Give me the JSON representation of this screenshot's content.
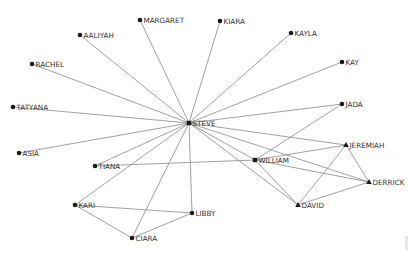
{
  "graph": {
    "type": "network",
    "colors": {
      "edge": "#8a8a8a",
      "node": "#1a1a1a",
      "label": "#333333",
      "background": "#ffffff"
    },
    "nodes": [
      {
        "id": "STEVE",
        "label": "STEVE",
        "x": 189,
        "y": 123,
        "shape": "square"
      },
      {
        "id": "MARGARET",
        "label": "MARGARET",
        "x": 140,
        "y": 20,
        "shape": "circle"
      },
      {
        "id": "KIARA",
        "label": "KIARA",
        "x": 220,
        "y": 21,
        "shape": "circle"
      },
      {
        "id": "KAYLA",
        "label": "KAYLA",
        "x": 291,
        "y": 33,
        "shape": "circle"
      },
      {
        "id": "KAY",
        "label": "KAY",
        "x": 342,
        "y": 62,
        "shape": "circle"
      },
      {
        "id": "JADA",
        "label": "JADA",
        "x": 342,
        "y": 104,
        "shape": "circle"
      },
      {
        "id": "AALIYAH",
        "label": "AALIYAH",
        "x": 80,
        "y": 35,
        "shape": "circle"
      },
      {
        "id": "RACHEL",
        "label": "RACHEL",
        "x": 32,
        "y": 64,
        "shape": "circle"
      },
      {
        "id": "TATYANA",
        "label": "TATYANA",
        "x": 13,
        "y": 107,
        "shape": "circle"
      },
      {
        "id": "ASIA",
        "label": "ASIA",
        "x": 19,
        "y": 153,
        "shape": "circle"
      },
      {
        "id": "TIANA",
        "label": "TIANA",
        "x": 95,
        "y": 166,
        "shape": "circle"
      },
      {
        "id": "KARI",
        "label": "KARI",
        "x": 75,
        "y": 205,
        "shape": "circle"
      },
      {
        "id": "CIARA",
        "label": "CIARA",
        "x": 132,
        "y": 238,
        "shape": "circle"
      },
      {
        "id": "LIBBY",
        "label": "LIBBY",
        "x": 192,
        "y": 213,
        "shape": "circle"
      },
      {
        "id": "WILLIAM",
        "label": "WILLIAM",
        "x": 255,
        "y": 160,
        "shape": "square"
      },
      {
        "id": "JEREMIAH",
        "label": "JEREMIAH",
        "x": 346,
        "y": 145,
        "shape": "triangle"
      },
      {
        "id": "DERRICK",
        "label": "DERRICK",
        "x": 369,
        "y": 182,
        "shape": "triangle"
      },
      {
        "id": "DAVID",
        "label": "DAVID",
        "x": 298,
        "y": 205,
        "shape": "triangle"
      }
    ],
    "edges": [
      [
        "STEVE",
        "MARGARET"
      ],
      [
        "STEVE",
        "KIARA"
      ],
      [
        "STEVE",
        "KAYLA"
      ],
      [
        "STEVE",
        "KAY"
      ],
      [
        "STEVE",
        "JADA"
      ],
      [
        "STEVE",
        "AALIYAH"
      ],
      [
        "STEVE",
        "RACHEL"
      ],
      [
        "STEVE",
        "TATYANA"
      ],
      [
        "STEVE",
        "ASIA"
      ],
      [
        "STEVE",
        "TIANA"
      ],
      [
        "STEVE",
        "KARI"
      ],
      [
        "STEVE",
        "CIARA"
      ],
      [
        "STEVE",
        "LIBBY"
      ],
      [
        "STEVE",
        "WILLIAM"
      ],
      [
        "STEVE",
        "JEREMIAH"
      ],
      [
        "STEVE",
        "DERRICK"
      ],
      [
        "STEVE",
        "DAVID"
      ],
      [
        "TIANA",
        "WILLIAM"
      ],
      [
        "KARI",
        "LIBBY"
      ],
      [
        "KARI",
        "CIARA"
      ],
      [
        "CIARA",
        "LIBBY"
      ],
      [
        "JADA",
        "WILLIAM"
      ],
      [
        "WILLIAM",
        "JEREMIAH"
      ],
      [
        "WILLIAM",
        "DERRICK"
      ],
      [
        "WILLIAM",
        "DAVID"
      ],
      [
        "JEREMIAH",
        "DERRICK"
      ],
      [
        "JEREMIAH",
        "DAVID"
      ],
      [
        "DAVID",
        "DERRICK"
      ]
    ]
  }
}
